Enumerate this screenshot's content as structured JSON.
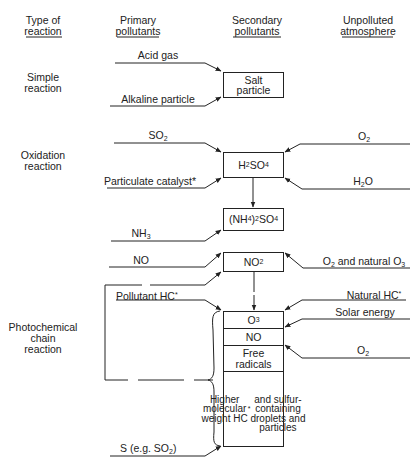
{
  "headers": {
    "type": "Type of\nreaction",
    "primary": "Primary\npollutants",
    "secondary": "Secondary\npollutants",
    "unpolluted": "Unpolluted\natmosphere"
  },
  "reaction_types": {
    "simple": "Simple\nreaction",
    "oxidation": "Oxidation\nreaction",
    "photochemical": "Photochemical\nchain\nreaction"
  },
  "primary_pollutants": {
    "acid_gas": "Acid gas",
    "alkaline_particle": "Alkaline particle",
    "so2": "SO2",
    "particulate_catalyst": "Particulate catalyst*",
    "nh3": "NH3",
    "no": "NO",
    "pollutant_hc": "Pollutant HC*",
    "s_eg_so2": "S (e.g. SO2)"
  },
  "secondary_pollutants": {
    "salt_particle": "Salt\nparticle",
    "h2so4": "H2SO4",
    "nh4_2so4": "(NH4)2SO4",
    "no2": "NO2",
    "o3": "O3",
    "no": "NO",
    "free_radicals": "Free\nradicals",
    "higher_mw": "Higher\nmolecular\nweight HC*\nand sulfur-\ncontaining\ndroplets and\nparticles"
  },
  "unpolluted_atmosphere": {
    "o2_a": "O2",
    "h2o": "H2O",
    "o2_natural_o3": "O2 and natural O3",
    "natural_hc": "Natural HC*",
    "solar_energy": "Solar energy",
    "o2_b": "O2"
  }
}
